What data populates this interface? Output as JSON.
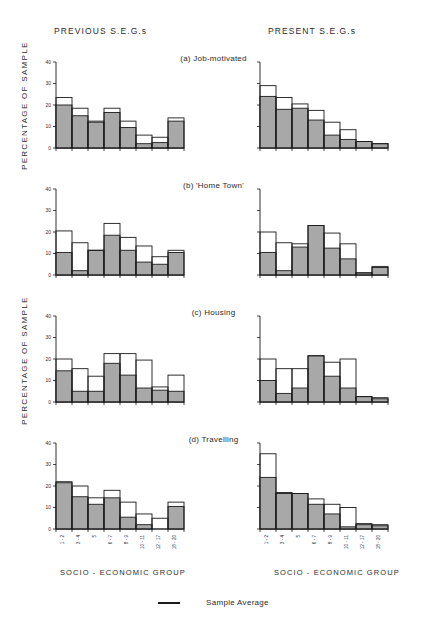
{
  "figure": {
    "column_headers": {
      "previous": "PREVIOUS  S.E.G.s",
      "present": "PRESENT  S.E.G.s"
    },
    "y_axis_title_top": "PERCENTAGE   OF   SAMPLE",
    "y_axis_title_bottom": "PERCENTAGE   OF   SAMPLE",
    "x_axis_title_left": "SOCIO - ECONOMIC  GROUP",
    "x_axis_title_right": "SOCIO - ECONOMIC  GROUP",
    "legend": {
      "marker_name": "sample-average-line",
      "label": "Sample Average"
    },
    "panel_titles": {
      "a": "(a) Job-motivated",
      "b": "(b) 'Home  Town'",
      "c": "(c) Housing",
      "d": "(d) Travelling"
    },
    "colors": {
      "bar_fill": "#a8a8a8",
      "bar_outline": "#1a1a1a",
      "average_line": "#1a1a1a",
      "background": "#ffffff",
      "text": "#2b2b2b"
    }
  },
  "chart_data": [
    {
      "id": "a-previous",
      "type": "bar",
      "title": "(a) Job-motivated",
      "panel": "a",
      "column": "PREVIOUS S.E.G.s",
      "xlabel": "SOCIO - ECONOMIC GROUP",
      "ylabel": "PERCENTAGE OF SAMPLE",
      "ylim": [
        0,
        40
      ],
      "yticks": [
        0,
        10,
        20,
        30,
        40
      ],
      "grid": false,
      "categories": [
        "1 - 2",
        "3 - 4",
        "5",
        "6 - 7",
        "8 - 9",
        "10 - 11",
        "12 - 17",
        "18 - 20"
      ],
      "series": [
        {
          "name": "Filled (grey) bar",
          "values": [
            20.0,
            15.0,
            12.0,
            16.5,
            9.5,
            2.0,
            2.5,
            12.5
          ]
        },
        {
          "name": "Outline (open) bar",
          "values": [
            23.5,
            18.5,
            12.5,
            18.5,
            12.5,
            6.0,
            5.0,
            14.0
          ]
        }
      ]
    },
    {
      "id": "a-present",
      "type": "bar",
      "title": "(a) Job-motivated",
      "panel": "a",
      "column": "PRESENT S.E.G.s",
      "xlabel": "SOCIO - ECONOMIC GROUP",
      "ylim": [
        0,
        40
      ],
      "yticks": [
        0,
        10,
        20,
        30,
        40
      ],
      "grid": false,
      "categories": [
        "1 - 2",
        "3 - 4",
        "5",
        "6 - 7",
        "8 - 9",
        "10 - 11",
        "12 - 17",
        "18 - 20"
      ],
      "series": [
        {
          "name": "Filled (grey) bar",
          "values": [
            24.0,
            18.0,
            18.5,
            13.0,
            6.0,
            4.0,
            3.0,
            2.0
          ]
        },
        {
          "name": "Outline (open) bar",
          "values": [
            29.0,
            23.5,
            20.5,
            17.5,
            12.0,
            8.5,
            3.0,
            2.0
          ]
        }
      ]
    },
    {
      "id": "b-previous",
      "type": "bar",
      "title": "(b) 'Home Town'",
      "panel": "b",
      "column": "PREVIOUS S.E.G.s",
      "xlabel": "SOCIO - ECONOMIC GROUP",
      "ylabel": "PERCENTAGE OF SAMPLE",
      "ylim": [
        0,
        40
      ],
      "yticks": [
        0,
        10,
        20,
        30,
        40
      ],
      "grid": false,
      "categories": [
        "1 - 2",
        "3 - 4",
        "5",
        "6 - 7",
        "8 - 9",
        "10 - 11",
        "12 - 17",
        "18 - 20"
      ],
      "series": [
        {
          "name": "Filled (grey) bar",
          "values": [
            10.5,
            2.0,
            11.5,
            18.5,
            11.5,
            6.0,
            5.0,
            10.5
          ]
        },
        {
          "name": "Outline (open) bar",
          "values": [
            20.5,
            15.0,
            11.5,
            24.0,
            17.5,
            13.5,
            8.5,
            11.5
          ]
        }
      ]
    },
    {
      "id": "b-present",
      "type": "bar",
      "title": "(b) 'Home Town'",
      "panel": "b",
      "column": "PRESENT S.E.G.s",
      "xlabel": "SOCIO - ECONOMIC GROUP",
      "ylim": [
        0,
        40
      ],
      "yticks": [
        0,
        10,
        20,
        30,
        40
      ],
      "grid": false,
      "categories": [
        "1 - 2",
        "3 - 4",
        "5",
        "6 - 7",
        "8 - 9",
        "10 - 11",
        "12 - 17",
        "18 - 20"
      ],
      "series": [
        {
          "name": "Filled (grey) bar",
          "values": [
            10.5,
            2.0,
            13.0,
            23.0,
            12.5,
            7.5,
            1.0,
            3.5
          ]
        },
        {
          "name": "Outline (open) bar",
          "values": [
            20.0,
            15.0,
            14.5,
            23.0,
            19.5,
            14.5,
            1.0,
            4.0
          ]
        }
      ]
    },
    {
      "id": "c-previous",
      "type": "bar",
      "title": "(c) Housing",
      "panel": "c",
      "column": "PREVIOUS S.E.G.s",
      "xlabel": "SOCIO - ECONOMIC GROUP",
      "ylabel": "PERCENTAGE OF SAMPLE",
      "ylim": [
        0,
        40
      ],
      "yticks": [
        0,
        10,
        20,
        30,
        40
      ],
      "grid": false,
      "categories": [
        "1 - 2",
        "3 - 4",
        "5",
        "6 - 7",
        "8 - 9",
        "10 - 11",
        "12 - 17",
        "18 - 20"
      ],
      "series": [
        {
          "name": "Filled (grey) bar",
          "values": [
            14.5,
            5.0,
            5.0,
            18.0,
            12.5,
            6.5,
            5.5,
            5.0
          ]
        },
        {
          "name": "Outline (open) bar",
          "values": [
            20.0,
            15.5,
            12.0,
            22.5,
            22.5,
            19.5,
            7.0,
            12.5
          ]
        }
      ]
    },
    {
      "id": "c-present",
      "type": "bar",
      "title": "(c) Housing",
      "panel": "c",
      "column": "PRESENT S.E.G.s",
      "xlabel": "SOCIO - ECONOMIC GROUP",
      "ylim": [
        0,
        40
      ],
      "yticks": [
        0,
        10,
        20,
        30,
        40
      ],
      "grid": false,
      "categories": [
        "1 - 2",
        "3 - 4",
        "5",
        "6 - 7",
        "8 - 9",
        "10 - 11",
        "12 - 17",
        "18 - 20"
      ],
      "series": [
        {
          "name": "Filled (grey) bar",
          "values": [
            10.0,
            4.0,
            6.5,
            21.5,
            12.0,
            6.5,
            2.5,
            1.5
          ]
        },
        {
          "name": "Outline (open) bar",
          "values": [
            20.0,
            15.5,
            15.5,
            21.5,
            18.5,
            20.0,
            2.5,
            2.0
          ]
        }
      ]
    },
    {
      "id": "d-previous",
      "type": "bar",
      "title": "(d) Travelling",
      "panel": "d",
      "column": "PREVIOUS S.E.G.s",
      "xlabel": "SOCIO - ECONOMIC GROUP",
      "ylabel": "PERCENTAGE OF SAMPLE",
      "ylim": [
        0,
        40
      ],
      "yticks": [
        0,
        10,
        20,
        30,
        40
      ],
      "grid": false,
      "categories": [
        "1 - 2",
        "3 - 4",
        "5",
        "6 - 7",
        "8 - 9",
        "10 - 11",
        "12 - 17",
        "18 - 20"
      ],
      "series": [
        {
          "name": "Filled (grey) bar",
          "values": [
            21.5,
            15.0,
            11.5,
            14.5,
            5.5,
            2.0,
            0.0,
            10.5
          ]
        },
        {
          "name": "Outline (open) bar",
          "values": [
            22.0,
            20.0,
            14.5,
            18.0,
            12.5,
            7.0,
            5.0,
            12.5
          ]
        }
      ]
    },
    {
      "id": "d-present",
      "type": "bar",
      "title": "(d) Travelling",
      "panel": "d",
      "column": "PRESENT S.E.G.s",
      "xlabel": "SOCIO - ECONOMIC GROUP",
      "ylim": [
        0,
        40
      ],
      "yticks": [
        0,
        10,
        20,
        30,
        40
      ],
      "grid": false,
      "categories": [
        "1 - 2",
        "3 - 4",
        "5",
        "6 - 7",
        "8 - 9",
        "10 - 11",
        "12 - 17",
        "18 - 20"
      ],
      "series": [
        {
          "name": "Filled (grey) bar",
          "values": [
            24.0,
            16.5,
            16.5,
            11.5,
            7.0,
            1.0,
            2.0,
            1.5
          ]
        },
        {
          "name": "Outline (open) bar",
          "values": [
            35.0,
            17.0,
            16.5,
            14.0,
            11.5,
            10.0,
            2.5,
            2.0
          ]
        }
      ]
    }
  ]
}
